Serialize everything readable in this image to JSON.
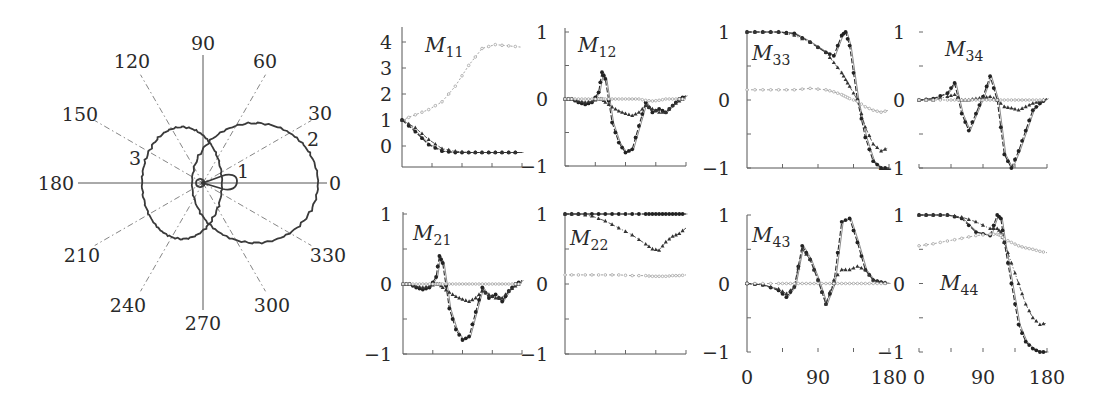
{
  "chart_data": [
    {
      "type": "polar",
      "panel": "polar-plot",
      "title": "",
      "angle_labels": [
        "0",
        "30",
        "60",
        "90",
        "120",
        "150",
        "180",
        "210",
        "240",
        "270",
        "300",
        "330"
      ],
      "angles_deg": [
        0,
        30,
        60,
        90,
        120,
        150,
        180,
        210,
        240,
        270,
        300,
        330
      ],
      "curve_labels": [
        "1",
        "2",
        "3"
      ],
      "series": [
        {
          "name": "1",
          "description": "small forward lobe",
          "r_at_0": 0.3,
          "r_at_180": 0.05
        },
        {
          "name": "2",
          "description": "large forward lobe (right circle)",
          "r_at_0": 1.0,
          "r_at_90": 0.5,
          "r_at_180": 0.1
        },
        {
          "name": "3",
          "description": "backward lobe (left circle)",
          "r_at_0": 0.15,
          "r_at_90": 0.45,
          "r_at_180": 0.53
        }
      ]
    },
    {
      "type": "line",
      "panel": "M11",
      "title": "M11",
      "title_main": "M",
      "title_sub": "11",
      "x": [
        0,
        20,
        40,
        60,
        80,
        100,
        120,
        140,
        160,
        180
      ],
      "xlim": [
        0,
        180
      ],
      "ylim": [
        -0.75,
        4.5
      ],
      "yticks": [
        0,
        1,
        2,
        3,
        4
      ],
      "ytick_labels": [
        "0",
        "1",
        "2",
        "3",
        "4"
      ],
      "series": [
        {
          "name": "open",
          "values": [
            1.0,
            1.2,
            1.4,
            1.7,
            2.3,
            3.1,
            3.75,
            3.9,
            3.85,
            3.8
          ]
        },
        {
          "name": "dots",
          "values": [
            1.0,
            0.55,
            0.05,
            -0.2,
            -0.25,
            -0.25,
            -0.25,
            -0.25,
            -0.25,
            -0.25
          ]
        },
        {
          "name": "triangles",
          "values": [
            1.0,
            0.7,
            0.25,
            -0.1,
            -0.2,
            -0.25,
            -0.25,
            -0.25,
            -0.25,
            -0.25
          ]
        }
      ]
    },
    {
      "type": "line",
      "panel": "M12",
      "title": "M12",
      "title_main": "M",
      "title_sub": "12",
      "x": [
        0,
        10,
        20,
        30,
        40,
        50,
        55,
        60,
        70,
        80,
        90,
        100,
        110,
        120,
        130,
        140,
        150,
        160,
        170,
        180
      ],
      "xlim": [
        0,
        180
      ],
      "ylim": [
        -1,
        1
      ],
      "yticks": [
        -1,
        -0.5,
        0,
        0.5,
        1
      ],
      "ytick_labels": [
        "−1",
        "",
        "0",
        "",
        "1"
      ],
      "series": [
        {
          "name": "dots",
          "values": [
            0,
            0,
            -0.05,
            -0.08,
            -0.05,
            0.1,
            0.4,
            0.3,
            -0.35,
            -0.65,
            -0.8,
            -0.75,
            -0.4,
            -0.05,
            -0.2,
            -0.15,
            -0.2,
            -0.1,
            0,
            0.05
          ]
        },
        {
          "name": "triangles",
          "values": [
            0,
            0,
            -0.03,
            -0.05,
            -0.03,
            0,
            0,
            -0.05,
            -0.12,
            -0.18,
            -0.22,
            -0.25,
            -0.2,
            -0.1,
            -0.15,
            -0.2,
            -0.2,
            -0.1,
            -0.03,
            0.02
          ]
        },
        {
          "name": "open",
          "values": [
            0,
            0,
            0,
            0,
            0,
            0,
            0,
            0,
            0,
            0,
            0,
            0,
            0,
            -0.02,
            -0.03,
            -0.02,
            0,
            0,
            0,
            0
          ]
        }
      ]
    },
    {
      "type": "line",
      "panel": "M33",
      "title": "M33",
      "title_main": "M",
      "title_sub": "33",
      "x": [
        0,
        20,
        40,
        60,
        80,
        100,
        110,
        120,
        125,
        130,
        140,
        150,
        160,
        170,
        180
      ],
      "xlim": [
        0,
        180
      ],
      "ylim": [
        -1,
        1
      ],
      "yticks": [
        -1,
        -0.5,
        0,
        0.5,
        1
      ],
      "ytick_labels": [
        "−1",
        "",
        "0",
        "",
        "1"
      ],
      "series": [
        {
          "name": "dots",
          "values": [
            1,
            1,
            1,
            0.98,
            0.85,
            0.7,
            0.65,
            0.95,
            1.0,
            0.8,
            0.0,
            -0.55,
            -0.9,
            -1,
            -1
          ]
        },
        {
          "name": "triangles",
          "values": [
            1,
            1,
            1,
            0.95,
            0.85,
            0.7,
            0.55,
            0.4,
            0.3,
            0.2,
            0.0,
            -0.4,
            -0.65,
            -0.75,
            -0.7
          ]
        },
        {
          "name": "open",
          "values": [
            0.15,
            0.15,
            0.15,
            0.15,
            0.17,
            0.15,
            0.12,
            0.08,
            0.05,
            0.02,
            -0.02,
            -0.1,
            -0.15,
            -0.18,
            -0.15
          ]
        }
      ]
    },
    {
      "type": "line",
      "panel": "M34",
      "title": "M34",
      "title_main": "M",
      "title_sub": "34",
      "x": [
        0,
        20,
        40,
        50,
        60,
        70,
        80,
        90,
        100,
        110,
        120,
        130,
        140,
        150,
        160,
        170,
        180
      ],
      "xlim": [
        0,
        180
      ],
      "ylim": [
        -1,
        1
      ],
      "yticks": [
        -1,
        -0.5,
        0,
        0.5,
        1
      ],
      "ytick_labels": [
        "−1",
        "",
        "0",
        "",
        "1"
      ],
      "series": [
        {
          "name": "dots",
          "values": [
            0,
            0.02,
            0.1,
            0.25,
            -0.2,
            -0.45,
            -0.2,
            0.05,
            0.35,
            0.0,
            -0.8,
            -1.0,
            -0.75,
            -0.45,
            -0.15,
            -0.05,
            0.02
          ]
        },
        {
          "name": "triangles",
          "values": [
            0,
            0,
            0.05,
            0.08,
            0,
            0,
            0.02,
            0.03,
            0.05,
            0,
            -0.1,
            -0.12,
            -0.15,
            -0.1,
            -0.05,
            -0.02,
            0.02
          ]
        },
        {
          "name": "open",
          "values": [
            0,
            0,
            0,
            0,
            0,
            0,
            0,
            0,
            0,
            0,
            0,
            0,
            0,
            0,
            0,
            0,
            0
          ]
        }
      ]
    },
    {
      "type": "line",
      "panel": "M21",
      "title": "M21",
      "title_main": "M",
      "title_sub": "21",
      "x": [
        0,
        10,
        20,
        30,
        40,
        50,
        55,
        60,
        70,
        80,
        90,
        100,
        110,
        120,
        130,
        140,
        150,
        160,
        170,
        180
      ],
      "xlim": [
        0,
        180
      ],
      "ylim": [
        -1,
        1
      ],
      "yticks": [
        -1,
        -0.5,
        0,
        0.5,
        1
      ],
      "ytick_labels": [
        "−1",
        "",
        "0",
        "",
        "1"
      ],
      "series": [
        {
          "name": "dots",
          "values": [
            0,
            0,
            -0.05,
            -0.08,
            -0.05,
            0.1,
            0.4,
            0.3,
            -0.35,
            -0.65,
            -0.8,
            -0.75,
            -0.4,
            -0.05,
            -0.2,
            -0.15,
            -0.25,
            -0.1,
            0,
            0.05
          ]
        },
        {
          "name": "triangles",
          "values": [
            0,
            0,
            -0.03,
            -0.05,
            -0.03,
            0,
            0,
            -0.05,
            -0.12,
            -0.18,
            -0.22,
            -0.25,
            -0.2,
            -0.1,
            -0.15,
            -0.2,
            -0.2,
            -0.1,
            -0.03,
            0.02
          ]
        },
        {
          "name": "open",
          "values": [
            0,
            0,
            0,
            0,
            0,
            0,
            0,
            0,
            0,
            0,
            0,
            0,
            0,
            0,
            0,
            0,
            0,
            0,
            0,
            0
          ]
        }
      ]
    },
    {
      "type": "line",
      "panel": "M22",
      "title": "M22",
      "title_main": "M",
      "title_sub": "22",
      "x": [
        0,
        20,
        40,
        60,
        80,
        100,
        120,
        130,
        140,
        150,
        160,
        170,
        180
      ],
      "xlim": [
        0,
        180
      ],
      "ylim": [
        -1,
        1
      ],
      "yticks": [
        -1,
        -0.5,
        0,
        0.5,
        1
      ],
      "ytick_labels": [
        "−1",
        "",
        "0",
        "",
        "1"
      ],
      "series": [
        {
          "name": "dots",
          "values": [
            1,
            1,
            1,
            1,
            1,
            1,
            1,
            1,
            1,
            1,
            1,
            1,
            1
          ]
        },
        {
          "name": "triangles",
          "values": [
            1,
            1,
            0.97,
            0.9,
            0.8,
            0.7,
            0.57,
            0.5,
            0.48,
            0.6,
            0.68,
            0.72,
            0.8
          ]
        },
        {
          "name": "open",
          "values": [
            0.13,
            0.13,
            0.13,
            0.13,
            0.13,
            0.12,
            0.12,
            0.11,
            0.11,
            0.11,
            0.12,
            0.12,
            0.13
          ]
        }
      ]
    },
    {
      "type": "line",
      "panel": "M43",
      "title": "M43",
      "title_main": "M",
      "title_sub": "43",
      "x": [
        0,
        20,
        40,
        50,
        60,
        70,
        80,
        90,
        100,
        110,
        120,
        130,
        140,
        150,
        160,
        170,
        180
      ],
      "xlim": [
        0,
        180
      ],
      "ylim": [
        -1,
        1
      ],
      "xticks": [
        0,
        90,
        180
      ],
      "xtick_labels": [
        "0",
        "90",
        "180"
      ],
      "yticks": [
        -1,
        -0.5,
        0,
        0.5,
        1
      ],
      "ytick_labels": [
        "−1",
        "",
        "0",
        "",
        "1"
      ],
      "series": [
        {
          "name": "dots",
          "values": [
            0,
            -0.02,
            -0.1,
            -0.2,
            -0.05,
            0.55,
            0.35,
            0.05,
            -0.3,
            0.0,
            0.9,
            0.95,
            0.6,
            0.2,
            0.05,
            0.02,
            0
          ]
        },
        {
          "name": "triangles",
          "values": [
            0,
            -0.02,
            -0.08,
            -0.15,
            -0.05,
            0.5,
            0.35,
            0.05,
            -0.3,
            0.05,
            0.2,
            0.2,
            0.25,
            0.2,
            0.05,
            0.02,
            0
          ]
        },
        {
          "name": "open",
          "values": [
            0,
            0,
            0,
            0,
            0,
            0,
            0,
            0,
            0,
            0,
            0,
            0,
            0,
            0,
            0,
            0,
            0
          ]
        }
      ]
    },
    {
      "type": "line",
      "panel": "M44",
      "title": "M44",
      "title_main": "M",
      "title_sub": "44",
      "x": [
        0,
        20,
        40,
        60,
        80,
        100,
        110,
        115,
        120,
        130,
        140,
        150,
        160,
        170,
        180
      ],
      "xlim": [
        0,
        180
      ],
      "ylim": [
        -1,
        1
      ],
      "xticks": [
        0,
        90,
        180
      ],
      "xtick_labels": [
        "0",
        "90",
        "180"
      ],
      "yticks": [
        -1,
        -0.5,
        0,
        0.5,
        1
      ],
      "ytick_labels": [
        "−1",
        "",
        "0",
        "",
        "1"
      ],
      "series": [
        {
          "name": "dots",
          "values": [
            1,
            1,
            1,
            0.95,
            0.75,
            0.7,
            1.0,
            0.95,
            0.6,
            0.0,
            -0.6,
            -0.85,
            -0.95,
            -1,
            -1
          ]
        },
        {
          "name": "triangles",
          "values": [
            1,
            1,
            1,
            0.97,
            0.9,
            0.8,
            0.8,
            0.75,
            0.6,
            0.3,
            0.0,
            -0.3,
            -0.5,
            -0.6,
            -0.58
          ]
        },
        {
          "name": "open",
          "values": [
            0.55,
            0.58,
            0.62,
            0.66,
            0.7,
            0.72,
            0.72,
            0.7,
            0.65,
            0.6,
            0.55,
            0.52,
            0.5,
            0.47,
            0.45
          ]
        }
      ]
    }
  ],
  "polar": {
    "angle_labels": [
      {
        "text": "0",
        "x": 335,
        "y": 190
      },
      {
        "text": "30",
        "x": 320,
        "y": 120
      },
      {
        "text": "60",
        "x": 265,
        "y": 68
      },
      {
        "text": "90",
        "x": 203,
        "y": 50
      },
      {
        "text": "120",
        "x": 132,
        "y": 68
      },
      {
        "text": "150",
        "x": 80,
        "y": 121
      },
      {
        "text": "180",
        "x": 56,
        "y": 190
      },
      {
        "text": "210",
        "x": 82,
        "y": 262
      },
      {
        "text": "240",
        "x": 128,
        "y": 312
      },
      {
        "text": "270",
        "x": 203,
        "y": 330
      },
      {
        "text": "300",
        "x": 272,
        "y": 312
      },
      {
        "text": "330",
        "x": 328,
        "y": 262
      }
    ],
    "curve_labels": [
      {
        "text": "1",
        "x": 243,
        "y": 178
      },
      {
        "text": "2",
        "x": 313,
        "y": 146
      },
      {
        "text": "3",
        "x": 135,
        "y": 165
      }
    ]
  }
}
